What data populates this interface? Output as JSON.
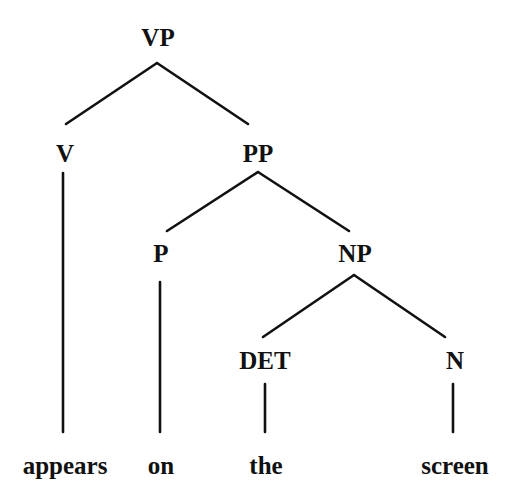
{
  "diagram": {
    "type": "syntax-tree",
    "nodes": {
      "vp": {
        "label": "VP",
        "x": 158,
        "y": 37
      },
      "v": {
        "label": "V",
        "x": 65,
        "y": 153
      },
      "pp": {
        "label": "PP",
        "x": 258,
        "y": 153
      },
      "p": {
        "label": "P",
        "x": 161,
        "y": 253
      },
      "np": {
        "label": "NP",
        "x": 355,
        "y": 253
      },
      "det": {
        "label": "DET",
        "x": 265,
        "y": 360
      },
      "n": {
        "label": "N",
        "x": 455,
        "y": 360
      }
    },
    "words": {
      "appears": {
        "label": "appears",
        "x": 65,
        "y": 465
      },
      "on": {
        "label": "on",
        "x": 161,
        "y": 465
      },
      "the": {
        "label": "the",
        "x": 266,
        "y": 465
      },
      "screen": {
        "label": "screen",
        "x": 455,
        "y": 465
      }
    },
    "edges": [
      {
        "from": "VP",
        "to": "V",
        "x1": 157,
        "y1": 63,
        "x2": 66,
        "y2": 124
      },
      {
        "from": "VP",
        "to": "PP",
        "x1": 157,
        "y1": 63,
        "x2": 248,
        "y2": 124
      },
      {
        "from": "V",
        "to": "appears",
        "x1": 63,
        "y1": 173,
        "x2": 63,
        "y2": 432
      },
      {
        "from": "PP",
        "to": "P",
        "x1": 258,
        "y1": 172,
        "x2": 167,
        "y2": 231
      },
      {
        "from": "PP",
        "to": "NP",
        "x1": 258,
        "y1": 172,
        "x2": 349,
        "y2": 231
      },
      {
        "from": "P",
        "to": "on",
        "x1": 160,
        "y1": 282,
        "x2": 160,
        "y2": 432
      },
      {
        "from": "NP",
        "to": "DET",
        "x1": 354,
        "y1": 275,
        "x2": 263,
        "y2": 337
      },
      {
        "from": "NP",
        "to": "N",
        "x1": 354,
        "y1": 275,
        "x2": 445,
        "y2": 337
      },
      {
        "from": "DET",
        "to": "the",
        "x1": 265,
        "y1": 384,
        "x2": 265,
        "y2": 432
      },
      {
        "from": "N",
        "to": "screen",
        "x1": 453,
        "y1": 384,
        "x2": 453,
        "y2": 432
      }
    ],
    "line_color": "#111111"
  }
}
